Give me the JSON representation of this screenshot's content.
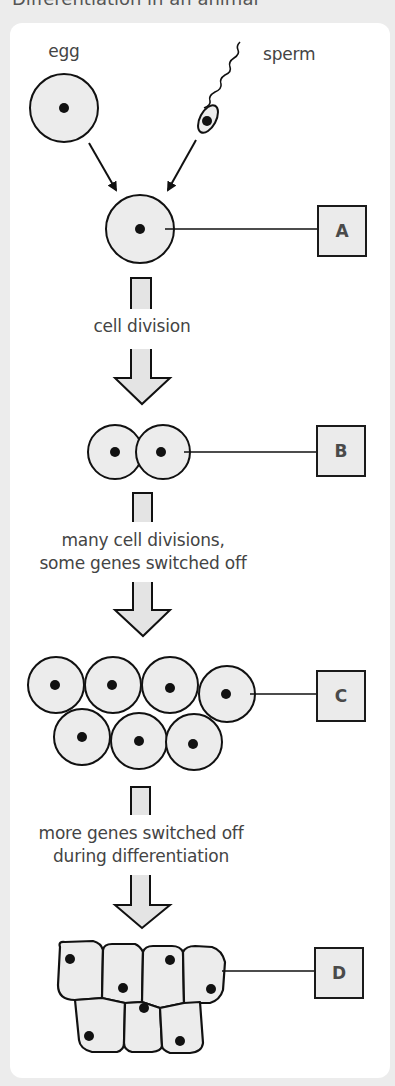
{
  "top_cutoff_text": "Differentiation in an animal",
  "labels": {
    "egg": "egg",
    "sperm": "sperm",
    "step1": "cell division",
    "step2_line1": "many cell divisions,",
    "step2_line2": "some genes switched off",
    "step3_line1": "more genes switched off",
    "step3_line2": "during differentiation"
  },
  "stages": [
    {
      "id": "A",
      "label": "A",
      "description": "single fertilised cell (zygote)"
    },
    {
      "id": "B",
      "label": "B",
      "description": "two cells"
    },
    {
      "id": "C",
      "label": "C",
      "description": "seven rounded cells"
    },
    {
      "id": "D",
      "label": "D",
      "description": "seven differentiated cells"
    }
  ],
  "colors": {
    "cell_fill": "#ececec",
    "outline": "#111111",
    "text": "#444444",
    "panel": "#ffffff",
    "background": "#ececec"
  }
}
